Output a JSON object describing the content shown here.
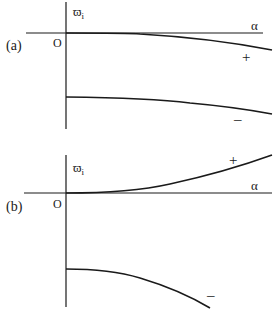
{
  "panels": [
    {
      "id": "a",
      "panel_label": "(a)",
      "y_axis_label": "ϖ",
      "y_axis_subscript": "i",
      "x_axis_label": "α",
      "origin_label": "O",
      "upper_branch_sign": "+",
      "lower_branch_sign": "–"
    },
    {
      "id": "b",
      "panel_label": "(b)",
      "y_axis_label": "ϖ",
      "y_axis_subscript": "i",
      "x_axis_label": "α",
      "origin_label": "O",
      "upper_branch_sign": "+",
      "lower_branch_sign": "–"
    }
  ],
  "colors": {
    "ink": "#1a1a1a",
    "background": "#ffffff"
  }
}
